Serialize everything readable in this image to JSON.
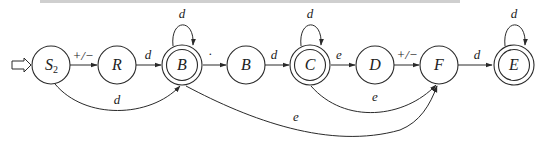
{
  "diagram": {
    "type": "finite-automaton",
    "start_state": "S2",
    "states": [
      {
        "id": "S2",
        "label": "S",
        "subscript": "2",
        "accepting": false,
        "cx": 51,
        "cy": 65
      },
      {
        "id": "R",
        "label": "R",
        "accepting": false,
        "cx": 117,
        "cy": 65
      },
      {
        "id": "B1",
        "label": "B",
        "accepting": true,
        "cx": 182,
        "cy": 65
      },
      {
        "id": "B2",
        "label": "B",
        "accepting": false,
        "cx": 246,
        "cy": 65
      },
      {
        "id": "C",
        "label": "C",
        "accepting": true,
        "cx": 310,
        "cy": 65
      },
      {
        "id": "D",
        "label": "D",
        "accepting": false,
        "cx": 375,
        "cy": 65
      },
      {
        "id": "F",
        "label": "F",
        "accepting": false,
        "cx": 439,
        "cy": 65
      },
      {
        "id": "E",
        "label": "E",
        "accepting": true,
        "cx": 514,
        "cy": 65
      }
    ],
    "transitions": [
      {
        "from": "S2",
        "to": "R",
        "label": "+/−"
      },
      {
        "from": "R",
        "to": "B1",
        "label": "d"
      },
      {
        "from": "S2",
        "to": "B1",
        "label": "d"
      },
      {
        "from": "B1",
        "to": "B1",
        "label": "d"
      },
      {
        "from": "B1",
        "to": "B2",
        "label": "·"
      },
      {
        "from": "B2",
        "to": "C",
        "label": "d"
      },
      {
        "from": "C",
        "to": "C",
        "label": "d"
      },
      {
        "from": "C",
        "to": "D",
        "label": "e"
      },
      {
        "from": "D",
        "to": "F",
        "label": "+/−"
      },
      {
        "from": "C",
        "to": "F",
        "label": "e"
      },
      {
        "from": "B1",
        "to": "F",
        "label": "e"
      },
      {
        "from": "F",
        "to": "E",
        "label": "d"
      },
      {
        "from": "E",
        "to": "E",
        "label": "d"
      }
    ]
  },
  "labels": {
    "S2_main": "S",
    "S2_sub": "2",
    "R": "R",
    "B1": "B",
    "B2": "B",
    "C": "C",
    "D": "D",
    "F": "F",
    "E": "E",
    "t_S2_R": "+/−",
    "t_R_B1": "d",
    "t_S2_B1": "d",
    "t_B1_loop": "d",
    "t_B1_B2": "·",
    "t_B2_C": "d",
    "t_C_loop": "d",
    "t_C_D": "e",
    "t_D_F": "+/−",
    "t_C_F": "e",
    "t_B1_F": "e",
    "t_F_E": "d",
    "t_E_loop": "d"
  }
}
